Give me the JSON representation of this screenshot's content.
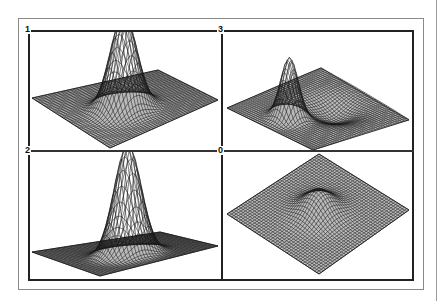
{
  "figure": {
    "panels": [
      {
        "id": "1",
        "label": "1",
        "position": "top-left",
        "surface": "tall narrow gaussian peak on flat plane",
        "peak_height": 1.0,
        "dip": 0.0,
        "tilt": "front"
      },
      {
        "id": "3",
        "label": "3",
        "position": "top-right",
        "surface": "narrow peak at back with shallow depression/ridge in front",
        "peak_height": 0.75,
        "dip": 0.35,
        "tilt": "front"
      },
      {
        "id": "2",
        "label": "2",
        "position": "bottom-left",
        "surface": "tall gaussian peak on flat plane, flatter view",
        "peak_height": 1.2,
        "dip": 0.0,
        "tilt": "low"
      },
      {
        "id": "0",
        "label": "0",
        "position": "bottom-right",
        "surface": "small low bump on diamond-shaped plane",
        "peak_height": 0.25,
        "dip": 0.0,
        "tilt": "top"
      }
    ]
  },
  "colors": {
    "frame": "#222222",
    "outer_frame": "#8a8a8a",
    "mesh": "#1a1a1a",
    "background": "#ffffff"
  }
}
